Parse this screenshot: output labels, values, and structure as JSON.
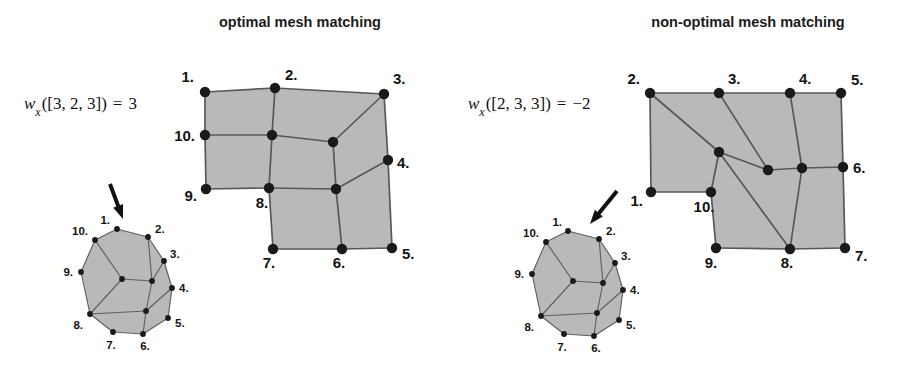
{
  "figure": {
    "background_color": "#ffffff",
    "mesh_fill_color": "#b9b9b9",
    "mesh_edge_color": "#585858",
    "node_color": "#1a1a1a"
  },
  "panels": [
    {
      "id": "optimal",
      "title": "optimal mesh matching",
      "title_x": 300,
      "title_y": 27,
      "formula": {
        "x": 24,
        "y": 109,
        "w": "w",
        "subscript": "x",
        "argument": "([3, 2, 3])",
        "equals": "=",
        "value": "3",
        "full_text": "w_x([3, 2, 3]) = 3"
      },
      "big_mesh": {
        "nodes": [
          {
            "label": "1.",
            "x": 205,
            "y": 92,
            "lx": 194,
            "ly": 82,
            "anchor": "end"
          },
          {
            "label": "2.",
            "x": 275,
            "y": 88,
            "lx": 285,
            "ly": 80,
            "anchor": "start"
          },
          {
            "label": "3.",
            "x": 384,
            "y": 94,
            "lx": 393,
            "ly": 84,
            "anchor": "start"
          },
          {
            "label": "4.",
            "x": 388,
            "y": 160,
            "lx": 397,
            "ly": 168,
            "anchor": "start"
          },
          {
            "label": "5.",
            "x": 392,
            "y": 248,
            "lx": 402,
            "ly": 259,
            "anchor": "start"
          },
          {
            "label": "6.",
            "x": 342,
            "y": 249,
            "lx": 339,
            "ly": 268,
            "anchor": "middle"
          },
          {
            "label": "7.",
            "x": 273,
            "y": 249,
            "lx": 269,
            "ly": 268,
            "anchor": "middle"
          },
          {
            "label": "8.",
            "x": 269,
            "y": 188,
            "lx": 262,
            "ly": 208,
            "anchor": "middle"
          },
          {
            "label": "9.",
            "x": 206,
            "y": 189,
            "lx": 197,
            "ly": 201,
            "anchor": "end"
          },
          {
            "label": "10.",
            "x": 205,
            "y": 135,
            "lx": 195,
            "ly": 141,
            "anchor": "end"
          },
          {
            "label": "",
            "x": 272,
            "y": 135,
            "lx": 0,
            "ly": 0,
            "anchor": "middle"
          },
          {
            "label": "",
            "x": 333,
            "y": 142,
            "lx": 0,
            "ly": 0,
            "anchor": "middle"
          },
          {
            "label": "",
            "x": 336,
            "y": 189,
            "lx": 0,
            "ly": 0,
            "anchor": "middle"
          }
        ],
        "outline": "205,92 275,88 384,94 388,160 392,248 342,249 273,249 269,188 206,189 205,135",
        "edges": [
          "205,92 275,88",
          "275,88 384,94",
          "384,94 388,160",
          "388,160 392,248",
          "392,248 342,249",
          "342,249 273,249",
          "273,249 269,188",
          "269,188 206,189",
          "206,189 205,135",
          "205,135 205,92",
          "205,135 272,135",
          "272,135 333,142",
          "272,135 275,88",
          "333,142 384,94",
          "333,142 336,189",
          "336,189 388,160",
          "336,189 269,188",
          "336,189 342,249",
          "272,135 269,188"
        ]
      },
      "small_mesh": {
        "arrow": {
          "x1": 110,
          "y1": 184,
          "x2": 123,
          "y2": 219
        },
        "nodes": [
          {
            "label": "1.",
            "x": 117,
            "y": 229,
            "lx": 110,
            "ly": 224,
            "anchor": "end"
          },
          {
            "label": "2.",
            "x": 148,
            "y": 237,
            "lx": 155,
            "ly": 233,
            "anchor": "start"
          },
          {
            "label": "3.",
            "x": 164,
            "y": 261,
            "lx": 170,
            "ly": 258,
            "anchor": "start"
          },
          {
            "label": "4.",
            "x": 172,
            "y": 288,
            "lx": 179,
            "ly": 292,
            "anchor": "start"
          },
          {
            "label": "5.",
            "x": 168,
            "y": 318,
            "lx": 175,
            "ly": 327,
            "anchor": "start"
          },
          {
            "label": "6.",
            "x": 143,
            "y": 334,
            "lx": 145,
            "ly": 350,
            "anchor": "middle"
          },
          {
            "label": "7.",
            "x": 113,
            "y": 332,
            "lx": 111,
            "ly": 349,
            "anchor": "middle"
          },
          {
            "label": "8.",
            "x": 90,
            "y": 314,
            "lx": 83,
            "ly": 329,
            "anchor": "end"
          },
          {
            "label": "9.",
            "x": 81,
            "y": 272,
            "lx": 73,
            "ly": 276,
            "anchor": "end"
          },
          {
            "label": "10.",
            "x": 95,
            "y": 240,
            "lx": 88,
            "ly": 235,
            "anchor": "end"
          },
          {
            "label": "",
            "x": 122,
            "y": 279,
            "lx": 0,
            "ly": 0,
            "anchor": "middle"
          },
          {
            "label": "",
            "x": 152,
            "y": 281,
            "lx": 0,
            "ly": 0,
            "anchor": "middle"
          },
          {
            "label": "",
            "x": 146,
            "y": 311,
            "lx": 0,
            "ly": 0,
            "anchor": "middle"
          }
        ],
        "outline": "117,229 148,237 164,261 172,288 168,318 143,334 113,332 90,314 81,272 95,240",
        "edges": [
          "117,229 148,237",
          "148,237 164,261",
          "164,261 172,288",
          "172,288 168,318",
          "168,318 143,334",
          "143,334 113,332",
          "113,332 90,314",
          "90,314 81,272",
          "81,272 95,240",
          "95,240 117,229",
          "95,240 122,279",
          "122,279 152,281",
          "152,281 148,237",
          "152,281 164,261",
          "152,281 146,311",
          "146,311 172,288",
          "146,311 90,314",
          "146,311 143,334",
          "122,279 90,314"
        ]
      }
    },
    {
      "id": "non-optimal",
      "title": "non-optimal mesh matching",
      "title_x": 748,
      "title_y": 27,
      "formula": {
        "x": 468,
        "y": 109,
        "w": "w",
        "subscript": "x",
        "argument": "([2, 3, 3])",
        "equals": "=",
        "value": "−2",
        "full_text": "w_x([2, 3, 3]) = −2"
      },
      "big_mesh": {
        "nodes": [
          {
            "label": "2.",
            "x": 650,
            "y": 93,
            "lx": 640,
            "ly": 84,
            "anchor": "end"
          },
          {
            "label": "3.",
            "x": 719,
            "y": 93,
            "lx": 728,
            "ly": 84,
            "anchor": "start"
          },
          {
            "label": "4.",
            "x": 790,
            "y": 93,
            "lx": 799,
            "ly": 84,
            "anchor": "start"
          },
          {
            "label": "5.",
            "x": 841,
            "y": 93,
            "lx": 851,
            "ly": 85,
            "anchor": "start"
          },
          {
            "label": "6.",
            "x": 843,
            "y": 167,
            "lx": 853,
            "ly": 173,
            "anchor": "start"
          },
          {
            "label": "7.",
            "x": 845,
            "y": 248,
            "lx": 855,
            "ly": 261,
            "anchor": "start"
          },
          {
            "label": "8.",
            "x": 790,
            "y": 249,
            "lx": 787,
            "ly": 268,
            "anchor": "middle"
          },
          {
            "label": "9.",
            "x": 716,
            "y": 248,
            "lx": 711,
            "ly": 268,
            "anchor": "middle"
          },
          {
            "label": "10.",
            "x": 711,
            "y": 192,
            "lx": 704,
            "ly": 212,
            "anchor": "middle"
          },
          {
            "label": "1.",
            "x": 651,
            "y": 192,
            "lx": 643,
            "ly": 206,
            "anchor": "end"
          },
          {
            "label": "",
            "x": 719,
            "y": 152,
            "lx": 0,
            "ly": 0,
            "anchor": "middle"
          },
          {
            "label": "",
            "x": 768,
            "y": 170,
            "lx": 0,
            "ly": 0,
            "anchor": "middle"
          },
          {
            "label": "",
            "x": 802,
            "y": 168,
            "lx": 0,
            "ly": 0,
            "anchor": "middle"
          }
        ],
        "outline": "650,93 719,93 790,93 841,93 843,167 845,248 790,249 716,248 711,192 651,192",
        "edges": [
          "650,93 719,93",
          "719,93 790,93",
          "790,93 841,93",
          "841,93 843,167",
          "843,167 845,248",
          "845,248 790,249",
          "790,249 716,248",
          "716,248 711,192",
          "711,192 651,192",
          "651,192 650,93",
          "650,93 719,152",
          "719,152 711,192",
          "719,152 768,170",
          "719,93 768,170",
          "768,170 802,168",
          "790,93 802,168",
          "802,168 843,167",
          "802,168 790,249",
          "719,152 790,249"
        ]
      },
      "small_mesh": {
        "arrow": {
          "x1": 617,
          "y1": 191,
          "x2": 590,
          "y2": 224
        },
        "nodes": [
          {
            "label": "1.",
            "x": 568,
            "y": 231,
            "lx": 562,
            "ly": 226,
            "anchor": "end"
          },
          {
            "label": "2.",
            "x": 599,
            "y": 239,
            "lx": 606,
            "ly": 235,
            "anchor": "start"
          },
          {
            "label": "3.",
            "x": 615,
            "y": 263,
            "lx": 621,
            "ly": 260,
            "anchor": "start"
          },
          {
            "label": "4.",
            "x": 623,
            "y": 290,
            "lx": 630,
            "ly": 294,
            "anchor": "start"
          },
          {
            "label": "5.",
            "x": 619,
            "y": 320,
            "lx": 626,
            "ly": 329,
            "anchor": "start"
          },
          {
            "label": "6.",
            "x": 594,
            "y": 336,
            "lx": 596,
            "ly": 352,
            "anchor": "middle"
          },
          {
            "label": "7.",
            "x": 564,
            "y": 334,
            "lx": 562,
            "ly": 351,
            "anchor": "middle"
          },
          {
            "label": "8.",
            "x": 541,
            "y": 316,
            "lx": 534,
            "ly": 331,
            "anchor": "end"
          },
          {
            "label": "9.",
            "x": 532,
            "y": 274,
            "lx": 524,
            "ly": 278,
            "anchor": "end"
          },
          {
            "label": "10.",
            "x": 546,
            "y": 242,
            "lx": 539,
            "ly": 237,
            "anchor": "end"
          },
          {
            "label": "",
            "x": 573,
            "y": 281,
            "lx": 0,
            "ly": 0,
            "anchor": "middle"
          },
          {
            "label": "",
            "x": 603,
            "y": 283,
            "lx": 0,
            "ly": 0,
            "anchor": "middle"
          },
          {
            "label": "",
            "x": 597,
            "y": 313,
            "lx": 0,
            "ly": 0,
            "anchor": "middle"
          }
        ],
        "outline": "568,231 599,239 615,263 623,290 619,320 594,336 564,334 541,316 532,274 546,242",
        "edges": [
          "568,231 599,239",
          "599,239 615,263",
          "615,263 623,290",
          "623,290 619,320",
          "619,320 594,336",
          "594,336 564,334",
          "564,334 541,316",
          "541,316 532,274",
          "532,274 546,242",
          "546,242 568,231",
          "546,242 573,281",
          "573,281 603,283",
          "603,283 599,239",
          "603,283 615,263",
          "603,283 597,313",
          "597,313 623,290",
          "597,313 541,316",
          "597,313 594,336",
          "573,281 541,316"
        ]
      }
    }
  ]
}
